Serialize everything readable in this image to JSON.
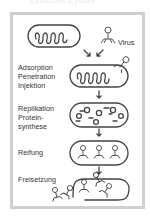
{
  "diagram": {
    "title_cut": "Lytischer Zyklus",
    "virus_label": "Virus",
    "stages": [
      {
        "label": "Adsorption\nPenetration\nInjektion"
      },
      {
        "label": "Replikation\nProtein-\nsynthese"
      },
      {
        "label": "Reifung"
      },
      {
        "label": "Freisetzung"
      }
    ],
    "colors": {
      "stroke": "#444444",
      "frame": "#cfcfcf",
      "text": "#333333"
    }
  }
}
